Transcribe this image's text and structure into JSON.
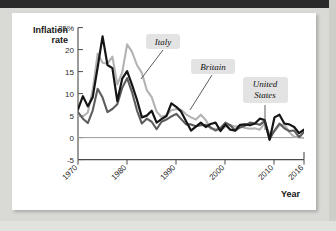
{
  "chart_data": {
    "type": "line",
    "title": "",
    "xlabel": "Year",
    "ylabel": "Inflation rate",
    "ylabel_line1": "Inflation",
    "ylabel_line2": "rate",
    "xlim": [
      1970,
      2016
    ],
    "ylim": [
      -5,
      25
    ],
    "yticks": [
      -5,
      0,
      5,
      10,
      15,
      20,
      25
    ],
    "ytick_labels": [
      "-5",
      "0",
      "5",
      "10",
      "15",
      "20",
      "25%"
    ],
    "xticks": [
      1970,
      1980,
      1990,
      2000,
      2010,
      2016
    ],
    "xtick_labels": [
      "1970",
      "1980",
      "1990",
      "2000",
      "2010",
      "2016"
    ],
    "grid": false,
    "legend_position": "inline-annotations",
    "zero_line": true,
    "x": [
      1970,
      1971,
      1972,
      1973,
      1974,
      1975,
      1976,
      1977,
      1978,
      1979,
      1980,
      1981,
      1982,
      1983,
      1984,
      1985,
      1986,
      1987,
      1988,
      1989,
      1990,
      1991,
      1992,
      1993,
      1994,
      1995,
      1996,
      1997,
      1998,
      1999,
      2000,
      2001,
      2002,
      2003,
      2004,
      2005,
      2006,
      2007,
      2008,
      2009,
      2010,
      2011,
      2012,
      2013,
      2014,
      2015,
      2016
    ],
    "series": [
      {
        "name": "Britain",
        "color": "#151515",
        "values": [
          6.4,
          9.4,
          7.1,
          9.2,
          16.0,
          23.0,
          16.5,
          15.8,
          8.3,
          13.4,
          15.1,
          12.0,
          8.6,
          4.6,
          5.0,
          6.1,
          3.4,
          4.2,
          4.9,
          7.8,
          7.0,
          5.9,
          3.7,
          1.6,
          2.5,
          3.4,
          2.4,
          3.1,
          3.4,
          1.5,
          3.0,
          1.8,
          1.6,
          2.9,
          3.0,
          2.8,
          3.2,
          4.3,
          4.0,
          -0.5,
          4.6,
          5.2,
          3.2,
          3.0,
          2.4,
          1.0,
          1.8
        ]
      },
      {
        "name": "United States",
        "color": "#5d5d5d",
        "values": [
          5.8,
          4.3,
          3.3,
          6.2,
          11.1,
          9.1,
          5.8,
          6.5,
          7.6,
          11.3,
          13.5,
          10.3,
          6.2,
          3.2,
          4.3,
          3.6,
          1.9,
          3.6,
          4.1,
          4.8,
          5.4,
          4.2,
          3.0,
          3.0,
          2.6,
          2.8,
          2.9,
          2.3,
          1.6,
          2.2,
          3.4,
          2.8,
          1.6,
          2.3,
          2.7,
          3.4,
          3.2,
          2.9,
          3.8,
          -0.4,
          1.6,
          3.2,
          2.1,
          1.5,
          1.6,
          0.1,
          1.3
        ]
      },
      {
        "name": "Italy",
        "color": "#b3b3b3",
        "values": [
          5.0,
          4.8,
          5.7,
          10.8,
          19.1,
          17.0,
          16.8,
          18.4,
          12.1,
          14.8,
          21.2,
          19.5,
          16.5,
          14.7,
          10.8,
          9.2,
          5.9,
          4.7,
          5.1,
          6.2,
          6.5,
          6.3,
          5.3,
          4.6,
          4.1,
          5.2,
          4.0,
          2.0,
          2.0,
          1.7,
          2.5,
          2.8,
          2.5,
          2.7,
          2.2,
          2.0,
          2.1,
          1.8,
          3.3,
          0.8,
          1.5,
          2.8,
          3.0,
          1.2,
          0.2,
          0.1,
          -0.1
        ]
      }
    ],
    "annotations": [
      {
        "label": "Italy",
        "target_series": "Italy"
      },
      {
        "label": "Britain",
        "target_series": "Britain"
      },
      {
        "label": "United States",
        "line1": "United",
        "line2": "States",
        "target_series": "United States"
      }
    ]
  }
}
